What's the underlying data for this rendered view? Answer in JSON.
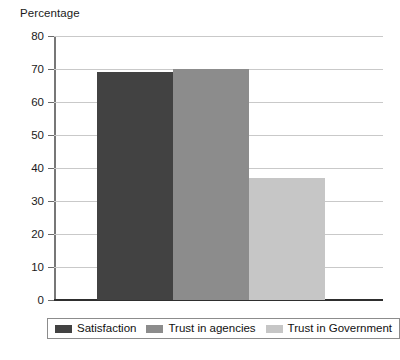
{
  "chart_data": {
    "type": "bar",
    "title": "",
    "ylabel": "Percentage",
    "xlabel": "",
    "categories": [
      "Satisfaction",
      "Trust in agencies",
      "Trust in Government"
    ],
    "values": [
      69,
      70,
      37
    ],
    "ylim": [
      0,
      80
    ],
    "ytick_step": 10,
    "ytick_labels": [
      "0",
      "10",
      "20",
      "30",
      "40",
      "50",
      "60",
      "70",
      "80"
    ],
    "xtick_labels": [],
    "grid": true,
    "grid_axis": "y",
    "legend_position": "bottom",
    "bar_gap": 0,
    "series": [
      {
        "name": "Satisfaction",
        "value": 69,
        "color": "#424242"
      },
      {
        "name": "Trust in agencies",
        "value": 70,
        "color": "#8c8c8c"
      },
      {
        "name": "Trust in Government",
        "value": 37,
        "color": "#c6c6c6"
      }
    ]
  },
  "axis": {
    "y_title": "Percentage"
  },
  "legend": {
    "items": [
      {
        "label": "Satisfaction",
        "color": "#424242"
      },
      {
        "label": "Trust in agencies",
        "color": "#8c8c8c"
      },
      {
        "label": "Trust in Government",
        "color": "#c6c6c6"
      }
    ]
  },
  "colors": {
    "gridline": "#c9c9c9",
    "baseline": "#2e2e2e",
    "axis": "#777777",
    "text": "#1a1a1a",
    "background": "#ffffff"
  }
}
